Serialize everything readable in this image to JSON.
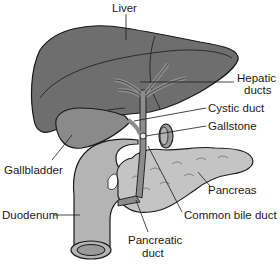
{
  "diagram": {
    "type": "anatomical illustration",
    "colors": {
      "liver": "#6e6e6e",
      "liver_highlight": "#7c7c7c",
      "gallbladder": "#8a8a8a",
      "ducts": "#8c8c8c",
      "duodenum": "#b4b4b4",
      "pancreas": "#c4c4c4",
      "outline": "#1a1a1a",
      "background": "#ffffff"
    },
    "labels": {
      "liver": "Liver",
      "hepatic_ducts_line1": "Hepatic",
      "hepatic_ducts_line2": "ducts",
      "cystic_duct": "Cystic duct",
      "gallstone": "Gallstone",
      "gallbladder": "Gallbladder",
      "pancreas": "Pancreas",
      "duodenum": "Duodenum",
      "common_bile_duct": "Common bile duct",
      "pancreatic_duct_line1": "Pancreatic",
      "pancreatic_duct_line2": "duct"
    }
  }
}
